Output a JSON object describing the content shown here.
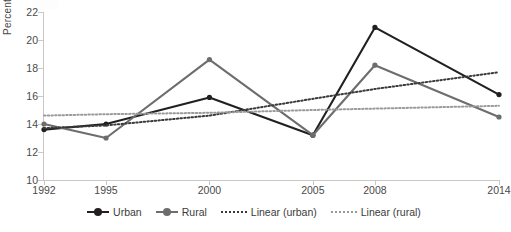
{
  "chart_data": {
    "type": "line",
    "title": "",
    "xlabel": "",
    "ylabel": "Percent",
    "categories": [
      "1992",
      "1995",
      "2000",
      "2005",
      "2008",
      "2014"
    ],
    "x": [
      1992,
      1995,
      2000,
      2005,
      2008,
      2014
    ],
    "ylim": [
      10,
      22
    ],
    "yticks": [
      "10",
      "12",
      "14",
      "16",
      "18",
      "20",
      "22"
    ],
    "grid": false,
    "legend_position": "bottom",
    "series": [
      {
        "name": "Urban",
        "style": "solid-markers",
        "color": "#231f20",
        "values": [
          13.6,
          14.0,
          15.9,
          13.2,
          20.9,
          16.1
        ]
      },
      {
        "name": "Rural",
        "style": "solid-markers",
        "color": "#6d6d6d",
        "values": [
          14.0,
          13.0,
          18.6,
          13.2,
          18.2,
          14.5
        ]
      },
      {
        "name": "Linear (urban)",
        "style": "dotted-trend",
        "color": "#3a3a3a",
        "values": [
          13.7,
          13.9,
          14.6,
          15.8,
          16.5,
          17.7
        ]
      },
      {
        "name": "Linear (rural)",
        "style": "dotted-trend",
        "color": "#9a9a9a",
        "values": [
          14.6,
          14.7,
          14.8,
          15.0,
          15.1,
          15.3
        ]
      }
    ]
  },
  "axis": {
    "y_title": "Percent",
    "y_ticks": [
      "22",
      "20",
      "18",
      "16",
      "14",
      "12",
      "10"
    ],
    "x_ticks": [
      "1992",
      "1995",
      "2000",
      "2005",
      "2008",
      "2014"
    ]
  },
  "legend": {
    "items": [
      {
        "label": "Urban"
      },
      {
        "label": "Rural"
      },
      {
        "label": "Linear (urban)"
      },
      {
        "label": "Linear (rural)"
      }
    ]
  }
}
